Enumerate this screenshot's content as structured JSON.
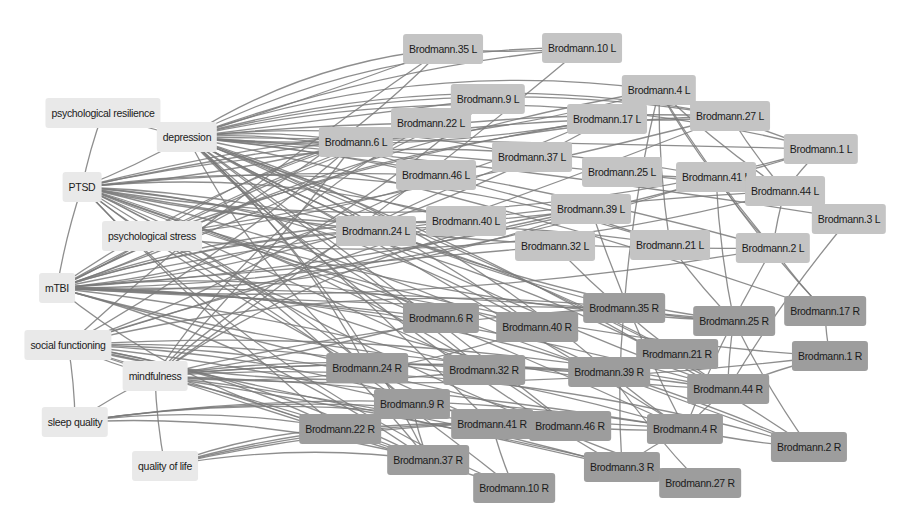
{
  "colors": {
    "category_node": "#e9e9e9",
    "left_hemisphere_node": "#c4c4c4",
    "right_hemisphere_node": "#9d9d9d",
    "edge": "#7a7a7a",
    "background": "#ffffff"
  },
  "nodes": [
    {
      "id": "psychological resilience",
      "group": "cat",
      "x": 103,
      "y": 113,
      "w": 112
    },
    {
      "id": "depression",
      "group": "cat",
      "x": 187,
      "y": 137,
      "w": 60
    },
    {
      "id": "PTSD",
      "group": "cat",
      "x": 82,
      "y": 187,
      "w": 60
    },
    {
      "id": "psychological stress",
      "group": "cat",
      "x": 152,
      "y": 236,
      "w": 62
    },
    {
      "id": "mTBI",
      "group": "cat",
      "x": 57,
      "y": 288,
      "w": 60
    },
    {
      "id": "social functioning",
      "group": "cat",
      "x": 68,
      "y": 345,
      "w": 60
    },
    {
      "id": "mindfulness",
      "group": "cat",
      "x": 155,
      "y": 376,
      "w": 62
    },
    {
      "id": "sleep quality",
      "group": "cat",
      "x": 75,
      "y": 422,
      "w": 60
    },
    {
      "id": "quality of life",
      "group": "cat",
      "x": 165,
      "y": 466,
      "w": 60
    },
    {
      "id": "Brodmann.35 L",
      "group": "left",
      "x": 443,
      "y": 49
    },
    {
      "id": "Brodmann.10 L",
      "group": "left",
      "x": 582,
      "y": 48
    },
    {
      "id": "Brodmann.9 L",
      "group": "left",
      "x": 488,
      "y": 99
    },
    {
      "id": "Brodmann.4 L",
      "group": "left",
      "x": 659,
      "y": 90
    },
    {
      "id": "Brodmann.22 L",
      "group": "left",
      "x": 431,
      "y": 123
    },
    {
      "id": "Brodmann.17 L",
      "group": "left",
      "x": 607,
      "y": 119
    },
    {
      "id": "Brodmann.27 L",
      "group": "left",
      "x": 730,
      "y": 116
    },
    {
      "id": "Brodmann.6 L",
      "group": "left",
      "x": 356,
      "y": 142
    },
    {
      "id": "Brodmann.37 L",
      "group": "left",
      "x": 532,
      "y": 157
    },
    {
      "id": "Brodmann.1 L",
      "group": "left",
      "x": 821,
      "y": 149
    },
    {
      "id": "Brodmann.46 L",
      "group": "left",
      "x": 436,
      "y": 175
    },
    {
      "id": "Brodmann.25 L",
      "group": "left",
      "x": 622,
      "y": 172
    },
    {
      "id": "Brodmann.41 L",
      "group": "left",
      "x": 716,
      "y": 177
    },
    {
      "id": "Brodmann.44 L",
      "group": "left",
      "x": 785,
      "y": 191
    },
    {
      "id": "Brodmann.39 L",
      "group": "left",
      "x": 591,
      "y": 209
    },
    {
      "id": "Brodmann.3 L",
      "group": "left",
      "x": 849,
      "y": 219
    },
    {
      "id": "Brodmann.40 L",
      "group": "left",
      "x": 466,
      "y": 221
    },
    {
      "id": "Brodmann.24 L",
      "group": "left",
      "x": 376,
      "y": 231
    },
    {
      "id": "Brodmann.32 L",
      "group": "left",
      "x": 555,
      "y": 246
    },
    {
      "id": "Brodmann.21 L",
      "group": "left",
      "x": 670,
      "y": 245
    },
    {
      "id": "Brodmann.2 L",
      "group": "left",
      "x": 773,
      "y": 248
    },
    {
      "id": "Brodmann.35 R",
      "group": "right",
      "x": 624,
      "y": 308
    },
    {
      "id": "Brodmann.17 R",
      "group": "right",
      "x": 825,
      "y": 311
    },
    {
      "id": "Brodmann.6 R",
      "group": "right",
      "x": 441,
      "y": 318
    },
    {
      "id": "Brodmann.25 R",
      "group": "right",
      "x": 734,
      "y": 321
    },
    {
      "id": "Brodmann.40 R",
      "group": "right",
      "x": 537,
      "y": 327
    },
    {
      "id": "Brodmann.21 R",
      "group": "right",
      "x": 677,
      "y": 354
    },
    {
      "id": "Brodmann.1 R",
      "group": "right",
      "x": 830,
      "y": 356
    },
    {
      "id": "Brodmann.24 R",
      "group": "right",
      "x": 367,
      "y": 368
    },
    {
      "id": "Brodmann.32 R",
      "group": "right",
      "x": 484,
      "y": 370
    },
    {
      "id": "Brodmann.39 R",
      "group": "right",
      "x": 609,
      "y": 372
    },
    {
      "id": "Brodmann.44 R",
      "group": "right",
      "x": 728,
      "y": 389
    },
    {
      "id": "Brodmann.9 R",
      "group": "right",
      "x": 412,
      "y": 404
    },
    {
      "id": "Brodmann.41 R",
      "group": "right",
      "x": 492,
      "y": 424
    },
    {
      "id": "Brodmann.46 R",
      "group": "right",
      "x": 570,
      "y": 426
    },
    {
      "id": "Brodmann.22 R",
      "group": "right",
      "x": 340,
      "y": 429
    },
    {
      "id": "Brodmann.4 R",
      "group": "right",
      "x": 685,
      "y": 429
    },
    {
      "id": "Brodmann.2 R",
      "group": "right",
      "x": 809,
      "y": 447
    },
    {
      "id": "Brodmann.37 R",
      "group": "right",
      "x": 428,
      "y": 460
    },
    {
      "id": "Brodmann.3 R",
      "group": "right",
      "x": 622,
      "y": 467
    },
    {
      "id": "Brodmann.27 R",
      "group": "right",
      "x": 700,
      "y": 483
    },
    {
      "id": "Brodmann.10 R",
      "group": "right",
      "x": 514,
      "y": 488
    }
  ],
  "edges": [
    [
      "psychological resilience",
      "depression"
    ],
    [
      "psychological resilience",
      "PTSD"
    ],
    [
      "PTSD",
      "depression"
    ],
    [
      "PTSD",
      "mTBI"
    ],
    [
      "PTSD",
      "psychological stress"
    ],
    [
      "mTBI",
      "psychological stress"
    ],
    [
      "social functioning",
      "mindfulness"
    ],
    [
      "mindfulness",
      "sleep quality"
    ],
    [
      "sleep quality",
      "social functioning"
    ],
    [
      "mindfulness",
      "quality of life"
    ],
    [
      "Brodmann.4 L",
      "Brodmann.27 L"
    ],
    [
      "Brodmann.4 L",
      "Brodmann.17 L"
    ],
    [
      "Brodmann.4 L",
      "Brodmann.41 L"
    ],
    [
      "Brodmann.4 L",
      "Brodmann.44 L"
    ],
    [
      "Brodmann.4 L",
      "Brodmann.2 L"
    ],
    [
      "Brodmann.4 L",
      "Brodmann.21 L"
    ],
    [
      "Brodmann.4 L",
      "Brodmann.35 R"
    ],
    [
      "Brodmann.27 L",
      "Brodmann.1 L"
    ],
    [
      "Brodmann.27 L",
      "Brodmann.44 L"
    ],
    [
      "Brodmann.1 L",
      "Brodmann.44 L"
    ],
    [
      "Brodmann.44 L",
      "Brodmann.3 L"
    ],
    [
      "Brodmann.44 L",
      "Brodmann.2 L"
    ],
    [
      "Brodmann.41 L",
      "Brodmann.44 L"
    ],
    [
      "Brodmann.41 L",
      "Brodmann.2 L"
    ],
    [
      "Brodmann.41 L",
      "Brodmann.25 R"
    ],
    [
      "Brodmann.41 L",
      "Brodmann.17 R"
    ],
    [
      "Brodmann.3 L",
      "Brodmann.44 R"
    ],
    [
      "Brodmann.2 L",
      "Brodmann.17 R"
    ],
    [
      "Brodmann.17 L",
      "Brodmann.27 L"
    ],
    [
      "Brodmann.25 L",
      "Brodmann.41 L"
    ],
    [
      "Brodmann.35 L",
      "Brodmann.10 L"
    ],
    [
      "Brodmann.25 R",
      "Brodmann.44 R"
    ],
    [
      "Brodmann.25 R",
      "Brodmann.2 R"
    ],
    [
      "Brodmann.17 R",
      "Brodmann.1 R"
    ],
    [
      "Brodmann.1 R",
      "Brodmann.44 R"
    ],
    [
      "Brodmann.44 R",
      "Brodmann.4 R"
    ],
    [
      "Brodmann.21 R",
      "Brodmann.44 R"
    ],
    [
      "Brodmann.4 R",
      "Brodmann.2 R"
    ],
    [
      "Brodmann.4 R",
      "Brodmann.3 R"
    ],
    [
      "Brodmann.39 R",
      "Brodmann.27 R"
    ],
    [
      "Brodmann.35 R",
      "Brodmann.3 R"
    ],
    [
      "Brodmann.35 R",
      "Brodmann.25 R"
    ],
    [
      "Brodmann.39 R",
      "Brodmann.4 R"
    ],
    [
      "Brodmann.46 R",
      "Brodmann.4 R"
    ],
    [
      "Brodmann.41 R",
      "Brodmann.10 R"
    ],
    [
      "Brodmann.9 R",
      "Brodmann.37 R"
    ],
    [
      "Brodmann.2 L",
      "Brodmann.4 R"
    ],
    [
      "Brodmann.21 L",
      "Brodmann.25 R"
    ],
    [
      "Brodmann.32 L",
      "Brodmann.21 R"
    ],
    [
      "Brodmann.39 L",
      "Brodmann.4 R"
    ]
  ],
  "hub_edges": {
    "sources": [
      "depression",
      "PTSD",
      "psychological stress",
      "mTBI",
      "social functioning",
      "mindfulness"
    ],
    "note": "dense bundle from left-side clinical nodes to Brodmann region nodes"
  }
}
